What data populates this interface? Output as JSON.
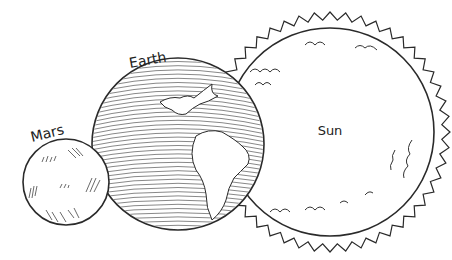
{
  "labels": {
    "mars": "Mars",
    "earth": "Earth",
    "sun": "Sun"
  },
  "colors": {
    "line": "#2a2a2a",
    "background": "#ffffff"
  }
}
